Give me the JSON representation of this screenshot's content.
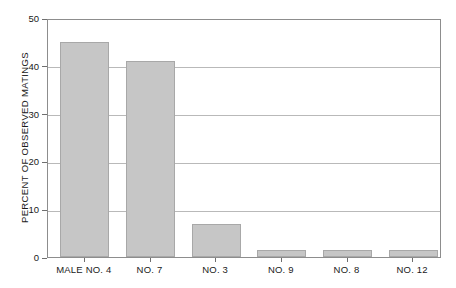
{
  "chart_data": {
    "type": "bar",
    "title": "",
    "subtitle": "",
    "xlabel": "",
    "ylabel": "PERCENT OF OBSERVED MATINGS",
    "categories": [
      "MALE NO. 4",
      "NO. 7",
      "NO. 3",
      "NO. 9",
      "NO. 8",
      "NO. 12"
    ],
    "values": [
      45,
      41,
      7,
      1.5,
      1.5,
      1.5
    ],
    "ylim": [
      0,
      50
    ],
    "yticks": [
      0,
      10,
      20,
      30,
      40,
      50
    ],
    "ytick_labels": [
      "0",
      "10",
      "20",
      "30",
      "40",
      "50"
    ],
    "grid": "horizontal",
    "legend": "none",
    "series": [
      {
        "name": "Percent of observed matings",
        "values": [
          45,
          41,
          7,
          1.5,
          1.5,
          1.5
        ]
      }
    ],
    "colors": {
      "bar_fill": "#c6c6c6",
      "bar_edge": "#a8a8a8",
      "grid": "#b9b9b9",
      "axis": "#8d8d8d",
      "text": "#1a1a1a",
      "background": "#ffffff"
    }
  }
}
